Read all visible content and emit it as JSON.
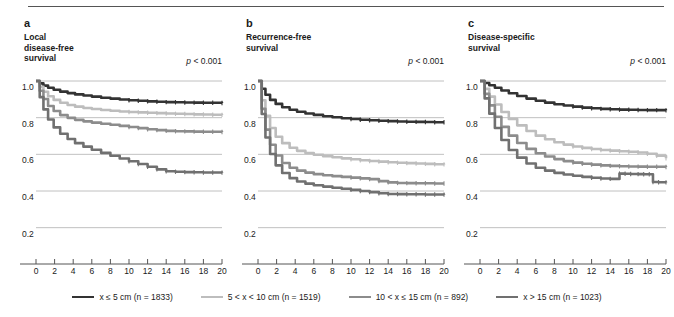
{
  "figure": {
    "panels": [
      {
        "letter": "a",
        "title": "Local\ndisease-free\nsurvival",
        "pvalue_prefix": "p",
        "pvalue_rest": " < 0.001"
      },
      {
        "letter": "b",
        "title": "Recurrence-free\nsurvival",
        "pvalue_prefix": "p",
        "pvalue_rest": " < 0.001"
      },
      {
        "letter": "c",
        "title": "Disease-specific\nsurvival",
        "pvalue_prefix": "p",
        "pvalue_rest": " < 0.001"
      }
    ],
    "legend": [
      {
        "label": "x ≤ 5 cm (n = 1833)",
        "color": "#333333"
      },
      {
        "label": "5 < x < 10 cm (n = 1519)",
        "color": "#bdbdbd"
      },
      {
        "label": "10 < x ≤ 15 cm (n = 892)",
        "color": "#8c8c8c"
      },
      {
        "label": "x > 15 cm (n = 1023)",
        "color": "#707070"
      }
    ]
  },
  "chart_data": [
    {
      "type": "line",
      "title": "Local disease-free survival",
      "xlabel": "Time (years)",
      "ylabel": "",
      "xlim": [
        0,
        20
      ],
      "ylim": [
        0.1,
        1.06
      ],
      "xticks": [
        0,
        2,
        4,
        6,
        8,
        10,
        12,
        14,
        16,
        18,
        20
      ],
      "yticks": [
        0.2,
        0.4,
        0.6,
        0.8,
        1.0
      ],
      "ytick_labels": [
        "0.2",
        "0.4",
        "0.6",
        "0.8",
        "1.0"
      ],
      "grid": "horizontal",
      "annotation": "p < 0.001",
      "series": [
        {
          "name": "x ≤ 5 cm (n = 1833)",
          "color": "#333333",
          "x": [
            0,
            0.4,
            0.8,
            1.3,
            1.9,
            2.6,
            3.4,
            4.2,
            5.1,
            6.0,
            7.0,
            8.0,
            9.0,
            10.0,
            11.0,
            12.0,
            13.0,
            14.0,
            15.0,
            16.0,
            17.0,
            18.0,
            19.0,
            20.0
          ],
          "y": [
            1.0,
            0.987,
            0.975,
            0.963,
            0.952,
            0.942,
            0.934,
            0.927,
            0.921,
            0.915,
            0.909,
            0.904,
            0.899,
            0.895,
            0.892,
            0.889,
            0.887,
            0.885,
            0.884,
            0.883,
            0.882,
            0.881,
            0.881,
            0.88
          ]
        },
        {
          "name": "5 < x < 10 cm (n = 1519)",
          "color": "#bdbdbd",
          "x": [
            0,
            0.4,
            0.8,
            1.3,
            1.9,
            2.6,
            3.4,
            4.2,
            5.1,
            6.0,
            7.0,
            8.0,
            9.0,
            10.0,
            11.0,
            12.0,
            13.0,
            14.0,
            15.0,
            16.0,
            17.0,
            18.0,
            19.0,
            20.0
          ],
          "y": [
            1.0,
            0.968,
            0.941,
            0.917,
            0.897,
            0.881,
            0.869,
            0.86,
            0.853,
            0.847,
            0.842,
            0.838,
            0.834,
            0.831,
            0.829,
            0.827,
            0.825,
            0.823,
            0.821,
            0.82,
            0.818,
            0.817,
            0.816,
            0.815
          ]
        },
        {
          "name": "10 < x ≤ 15 cm (n = 892)",
          "color": "#8c8c8c",
          "x": [
            0,
            0.4,
            0.8,
            1.3,
            1.9,
            2.6,
            3.4,
            4.2,
            5.1,
            6.0,
            7.0,
            8.0,
            9.0,
            10.0,
            11.0,
            12.0,
            13.0,
            14.0,
            15.0,
            16.0,
            17.0,
            18.0,
            19.0,
            20.0
          ],
          "y": [
            1.0,
            0.947,
            0.902,
            0.864,
            0.836,
            0.814,
            0.799,
            0.788,
            0.78,
            0.773,
            0.767,
            0.761,
            0.755,
            0.749,
            0.743,
            0.737,
            0.732,
            0.728,
            0.726,
            0.725,
            0.724,
            0.723,
            0.723,
            0.722
          ]
        },
        {
          "name": "x > 15 cm (n = 1023)",
          "color": "#707070",
          "x": [
            0,
            0.4,
            0.8,
            1.3,
            1.9,
            2.6,
            3.4,
            4.2,
            5.1,
            6.0,
            7.0,
            8.0,
            9.0,
            10.0,
            11.0,
            12.0,
            13.0,
            14.0,
            15.0,
            16.0,
            17.0,
            18.0,
            19.0,
            20.0
          ],
          "y": [
            1.0,
            0.912,
            0.845,
            0.79,
            0.747,
            0.712,
            0.684,
            0.661,
            0.642,
            0.625,
            0.608,
            0.592,
            0.577,
            0.562,
            0.547,
            0.532,
            0.518,
            0.508,
            0.505,
            0.503,
            0.502,
            0.501,
            0.501,
            0.5
          ]
        }
      ]
    },
    {
      "type": "line",
      "title": "Recurrence-free survival",
      "xlabel": "Time (years)",
      "ylabel": "",
      "xlim": [
        0,
        20
      ],
      "ylim": [
        0.1,
        1.06
      ],
      "xticks": [
        0,
        2,
        4,
        6,
        8,
        10,
        12,
        14,
        16,
        18,
        20
      ],
      "yticks": [
        0.2,
        0.4,
        0.6,
        0.8,
        1.0
      ],
      "ytick_labels": [
        "0.2",
        "0.4",
        "0.6",
        "0.8",
        "1.0"
      ],
      "grid": "horizontal",
      "annotation": "p < 0.001",
      "series": [
        {
          "name": "x ≤ 5 cm (n = 1833)",
          "color": "#333333",
          "x": [
            0,
            0.4,
            0.8,
            1.3,
            1.9,
            2.6,
            3.4,
            4.2,
            5.1,
            6.0,
            7.0,
            8.0,
            9.0,
            10.0,
            11.0,
            12.0,
            13.0,
            14.0,
            15.0,
            16.0,
            17.0,
            18.0,
            19.0,
            20.0
          ],
          "y": [
            1.0,
            0.958,
            0.925,
            0.897,
            0.875,
            0.857,
            0.843,
            0.832,
            0.823,
            0.815,
            0.808,
            0.802,
            0.797,
            0.793,
            0.789,
            0.786,
            0.783,
            0.781,
            0.779,
            0.778,
            0.777,
            0.776,
            0.775,
            0.775
          ]
        },
        {
          "name": "5 < x < 10 cm (n = 1519)",
          "color": "#bdbdbd",
          "x": [
            0,
            0.4,
            0.8,
            1.3,
            1.9,
            2.6,
            3.4,
            4.2,
            5.1,
            6.0,
            7.0,
            8.0,
            9.0,
            10.0,
            11.0,
            12.0,
            13.0,
            14.0,
            15.0,
            16.0,
            17.0,
            18.0,
            19.0,
            20.0
          ],
          "y": [
            1.0,
            0.895,
            0.81,
            0.744,
            0.696,
            0.661,
            0.636,
            0.619,
            0.607,
            0.598,
            0.59,
            0.584,
            0.578,
            0.573,
            0.568,
            0.564,
            0.56,
            0.557,
            0.554,
            0.552,
            0.55,
            0.548,
            0.546,
            0.545
          ]
        },
        {
          "name": "10 < x ≤ 15 cm (n = 892)",
          "color": "#8c8c8c",
          "x": [
            0,
            0.4,
            0.8,
            1.3,
            1.9,
            2.6,
            3.4,
            4.2,
            5.1,
            6.0,
            7.0,
            8.0,
            9.0,
            10.0,
            11.0,
            12.0,
            13.0,
            14.0,
            15.0,
            16.0,
            17.0,
            18.0,
            19.0,
            20.0
          ],
          "y": [
            1.0,
            0.848,
            0.735,
            0.652,
            0.594,
            0.553,
            0.527,
            0.511,
            0.5,
            0.492,
            0.486,
            0.481,
            0.477,
            0.473,
            0.469,
            0.465,
            0.454,
            0.447,
            0.444,
            0.443,
            0.442,
            0.442,
            0.441,
            0.441
          ]
        },
        {
          "name": "x > 15 cm (n = 1023)",
          "color": "#707070",
          "x": [
            0,
            0.4,
            0.8,
            1.3,
            1.9,
            2.6,
            3.4,
            4.2,
            5.1,
            6.0,
            7.0,
            8.0,
            9.0,
            10.0,
            11.0,
            12.0,
            13.0,
            14.0,
            15.0,
            16.0,
            17.0,
            18.0,
            19.0,
            20.0
          ],
          "y": [
            1.0,
            0.82,
            0.692,
            0.602,
            0.54,
            0.498,
            0.47,
            0.452,
            0.44,
            0.431,
            0.424,
            0.418,
            0.412,
            0.406,
            0.4,
            0.394,
            0.388,
            0.384,
            0.383,
            0.382,
            0.382,
            0.381,
            0.381,
            0.38
          ]
        }
      ]
    },
    {
      "type": "line",
      "title": "Disease-specific survival",
      "xlabel": "Time (years)",
      "ylabel": "",
      "xlim": [
        0,
        20
      ],
      "ylim": [
        0.1,
        1.06
      ],
      "xticks": [
        0,
        2,
        4,
        6,
        8,
        10,
        12,
        14,
        16,
        18,
        20
      ],
      "yticks": [
        0.2,
        0.4,
        0.6,
        0.8,
        1.0
      ],
      "ytick_labels": [
        "0.2",
        "0.4",
        "0.6",
        "0.8",
        "1.0"
      ],
      "grid": "horizontal",
      "annotation": "p < 0.001",
      "series": [
        {
          "name": "x ≤ 5 cm (n = 1833)",
          "color": "#333333",
          "x": [
            0,
            0.5,
            1.0,
            1.6,
            2.3,
            3.1,
            4.0,
            5.0,
            6.0,
            7.0,
            8.0,
            9.0,
            10.0,
            11.0,
            12.0,
            13.0,
            14.0,
            15.0,
            16.0,
            17.0,
            18.0,
            19.0,
            20.0
          ],
          "y": [
            1.0,
            0.989,
            0.977,
            0.963,
            0.948,
            0.933,
            0.918,
            0.904,
            0.892,
            0.882,
            0.873,
            0.866,
            0.86,
            0.855,
            0.851,
            0.848,
            0.846,
            0.844,
            0.843,
            0.842,
            0.841,
            0.841,
            0.84
          ]
        },
        {
          "name": "5 < x < 10 cm (n = 1519)",
          "color": "#bdbdbd",
          "x": [
            0,
            0.5,
            1.0,
            1.6,
            2.3,
            3.1,
            4.0,
            5.0,
            6.0,
            7.0,
            8.0,
            9.0,
            10.0,
            11.0,
            12.0,
            13.0,
            14.0,
            15.0,
            16.0,
            17.0,
            18.0,
            19.0,
            20.0
          ],
          "y": [
            1.0,
            0.957,
            0.915,
            0.872,
            0.831,
            0.793,
            0.758,
            0.727,
            0.702,
            0.682,
            0.666,
            0.653,
            0.643,
            0.635,
            0.629,
            0.624,
            0.62,
            0.617,
            0.614,
            0.61,
            0.603,
            0.592,
            0.578
          ]
        },
        {
          "name": "10 < x ≤ 15 cm (n = 892)",
          "color": "#8c8c8c",
          "x": [
            0,
            0.5,
            1.0,
            1.6,
            2.3,
            3.1,
            4.0,
            5.0,
            6.0,
            7.0,
            8.0,
            9.0,
            10.0,
            11.0,
            12.0,
            13.0,
            14.0,
            15.0,
            16.0,
            17.0,
            18.0,
            19.0,
            20.0
          ],
          "y": [
            1.0,
            0.93,
            0.867,
            0.805,
            0.75,
            0.702,
            0.662,
            0.63,
            0.606,
            0.588,
            0.574,
            0.563,
            0.555,
            0.549,
            0.544,
            0.54,
            0.537,
            0.535,
            0.534,
            0.533,
            0.532,
            0.532,
            0.531
          ]
        },
        {
          "name": "x > 15 cm (n = 1023)",
          "color": "#707070",
          "x": [
            0,
            0.5,
            1.0,
            1.6,
            2.3,
            3.1,
            4.0,
            5.0,
            6.0,
            7.0,
            8.0,
            9.0,
            10.0,
            11.0,
            12.0,
            13.0,
            14.0,
            15.0,
            15.6,
            16.2,
            17.0,
            17.6,
            18.2,
            18.6,
            19.2,
            20.0
          ],
          "y": [
            1.0,
            0.905,
            0.822,
            0.744,
            0.678,
            0.624,
            0.582,
            0.55,
            0.527,
            0.511,
            0.499,
            0.49,
            0.483,
            0.477,
            0.472,
            0.468,
            0.466,
            0.495,
            0.494,
            0.493,
            0.492,
            0.491,
            0.491,
            0.449,
            0.448,
            0.447
          ]
        }
      ]
    }
  ]
}
